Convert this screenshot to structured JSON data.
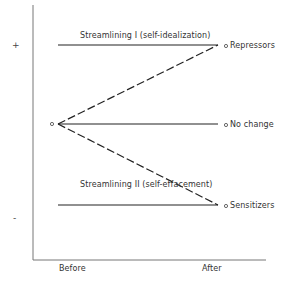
{
  "diagram": {
    "y_axis_signs": {
      "positive": "+",
      "negative": "-"
    },
    "x_axis_labels": {
      "before": "Before",
      "after": "After"
    },
    "lines": {
      "top_title": "Streamlining I (self-idealization)",
      "bottom_title": "Streamlining II (self-effacement)"
    },
    "end_points": {
      "repressors": "Repressors",
      "no_change": "No change",
      "sensitizers": "Sensitizers"
    },
    "origin_marker": "o",
    "colors": {
      "line": "#222222",
      "axis": "#666666",
      "background": "#ffffff"
    }
  }
}
